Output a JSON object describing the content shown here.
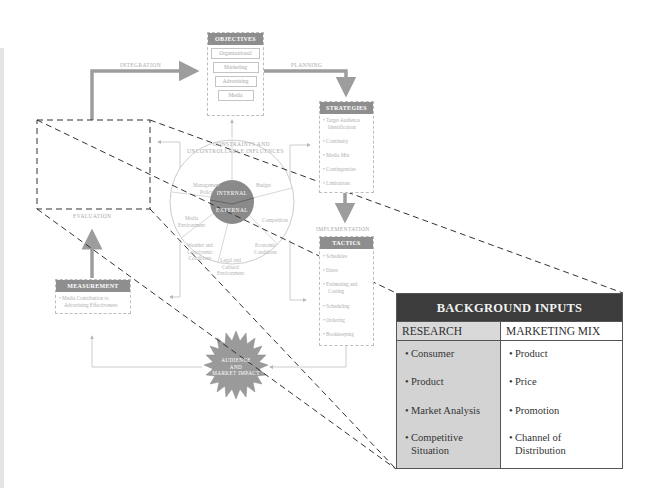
{
  "diagram": {
    "objectives": {
      "title": "OBJECTIVES",
      "items": [
        "Organizational",
        "Marketing",
        "Advertising",
        "Media"
      ]
    },
    "strategies": {
      "title": "STRATEGIES",
      "items": [
        "• Target Audience",
        "  Identification",
        "• Continuity",
        "• Media Mix",
        "• Contingencies",
        "• Limitations"
      ]
    },
    "tactics": {
      "title": "TACTICS",
      "items": [
        "• Schedules",
        "• Dates",
        "• Estimating and",
        "  Costing",
        "• Scheduling",
        "• Ordering",
        "• Bookkeeping"
      ]
    },
    "measurement": {
      "title": "MEASUREMENT",
      "items": [
        "• Media Contribution to",
        "  Advertising Effectiveness"
      ]
    },
    "flow_labels": {
      "integration": "INTEGRATION",
      "planning": "PLANNING",
      "implementation": "IMPLEMENTATION",
      "evaluation": "EVALUATION",
      "constraints_1": "CONSTRAINTS AND",
      "constraints_2": "UNCONTROLLABLE INFLUENCES"
    },
    "wheel": {
      "hub_top": "INTERNAL",
      "hub_bottom": "EXTERNAL",
      "segments": {
        "management_1": "Management",
        "management_2": "Policy",
        "budget": "Budget",
        "competition": "Competition",
        "economic_1": "Economic",
        "economic_2": "Conditions",
        "legal_1": "Legal and",
        "legal_2": "Cultural",
        "legal_3": "Environment",
        "weather_1": "Weather and",
        "weather_2": "Cataclysmic",
        "weather_3": "Conditions",
        "media_env_1": "Media",
        "media_env_2": "Environment"
      }
    },
    "starburst": {
      "line1": "AUDIENCE",
      "line2": "AND",
      "line3": "MARKET IMPACT"
    }
  },
  "background_inputs": {
    "title": "BACKGROUND INPUTS",
    "columns": [
      {
        "header": "RESEARCH",
        "items": [
          {
            "l1": "Consumer",
            "l2": ""
          },
          {
            "l1": "Product",
            "l2": ""
          },
          {
            "l1": "Market Analysis",
            "l2": ""
          },
          {
            "l1": "Competitive",
            "l2": "Situation"
          }
        ]
      },
      {
        "header": "MARKETING MIX",
        "items": [
          {
            "l1": "Product",
            "l2": ""
          },
          {
            "l1": "Price",
            "l2": ""
          },
          {
            "l1": "Promotion",
            "l2": ""
          },
          {
            "l1": "Channel of",
            "l2": "Distribution"
          }
        ]
      }
    ],
    "bullet": "•"
  },
  "colors": {
    "table_header_bg": "#3c3c3c",
    "research_col_bg": "#d3d3d3",
    "box_header_bg": "#8e8e8e",
    "arrow_gray": "#9d9d9d",
    "hub_gray": "#8a8a8a"
  }
}
